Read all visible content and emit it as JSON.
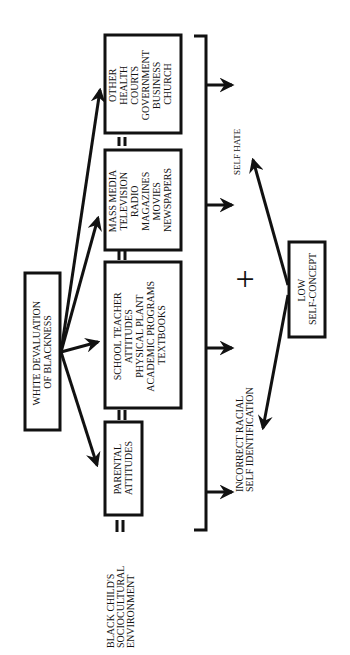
{
  "diagram": {
    "orientation": "rotated-90-ccw",
    "source": {
      "label_lines": [
        "WHITE DEVALUATION",
        "OF BLACKNESS"
      ]
    },
    "environment": {
      "label_lines": [
        "BLACK CHILD'S",
        "SOCIOCULTURAL",
        "ENVIRONMENT"
      ],
      "equals": "="
    },
    "influences": [
      {
        "id": "parental",
        "lines": [
          "PARENTAL",
          "ATTITUDES"
        ]
      },
      {
        "id": "school",
        "lines": [
          "SCHOOL TEACHER",
          "ATTITUDES",
          "PHYSICAL PLANT",
          "ACADEMIC PROGRAMS",
          "TEXTBOOKS"
        ]
      },
      {
        "id": "mass-media",
        "lines": [
          "MASS MEDIA",
          "TELEVISION",
          "RADIO",
          "MAGAZINES",
          "MOVIES",
          "NEWSPAPERS"
        ]
      },
      {
        "id": "other",
        "lines": [
          "OTHER",
          "HEALTH",
          "COURTS",
          "GOVERNMENT",
          "BUSINESS",
          "CHURCH"
        ]
      }
    ],
    "separator": "=",
    "combiner": "+",
    "outcome": {
      "label_lines": [
        "LOW",
        "SELF-CONCEPT"
      ]
    },
    "results": [
      {
        "id": "incorrect-racial",
        "lines": [
          "INCORRECT RACIAL",
          "SELF IDENTIFICATION"
        ]
      },
      {
        "id": "self-hate",
        "lines": [
          "SELF HATE"
        ]
      }
    ],
    "colors": {
      "ink": "#111111",
      "background": "#ffffff"
    }
  }
}
